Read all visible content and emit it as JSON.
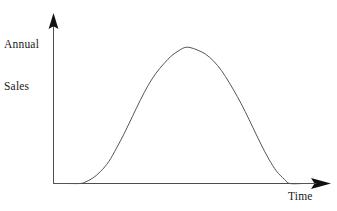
{
  "figure": {
    "background_color": "#ffffff",
    "line_color": "#555555",
    "axis_color": "#4d4d4d",
    "text_color": "#1a1a1a"
  },
  "axes": {
    "y_label_line1": "Annual",
    "y_label_line2": "Sales",
    "x_label": "Time",
    "y_arrow_name": "up-arrow-icon",
    "x_arrow_name": "right-arrow-icon"
  },
  "chart_data": {
    "type": "line",
    "title": "",
    "subtitle": "",
    "xlabel": "Time",
    "ylabel": "Annual Sales",
    "grid": false,
    "legend": null,
    "axis_ticks": {
      "x": [],
      "y": []
    },
    "xlim": [
      0,
      100
    ],
    "ylim": [
      0,
      100
    ],
    "series": [
      {
        "name": "Annual Sales",
        "x": [
          0,
          5,
          10,
          12,
          15,
          18,
          21,
          24,
          27,
          30,
          33,
          36,
          39,
          42,
          45,
          48,
          50,
          52,
          55,
          58,
          61,
          64,
          67,
          70,
          73,
          76,
          79,
          82,
          85,
          88,
          90,
          95,
          100
        ],
        "y": [
          0,
          0,
          0,
          1,
          4,
          9,
          16,
          26,
          37,
          49,
          61,
          72,
          81,
          88,
          94,
          98,
          100,
          100,
          98,
          95,
          90,
          83,
          74,
          64,
          53,
          41,
          29,
          18,
          9,
          3,
          0,
          0,
          0
        ]
      }
    ]
  }
}
